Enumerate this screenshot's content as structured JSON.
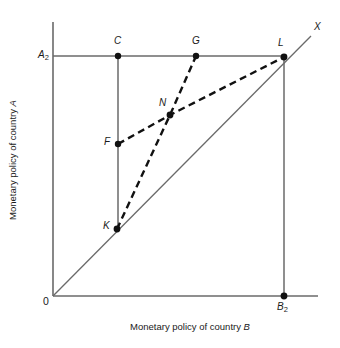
{
  "figure": {
    "title": "",
    "background_color": "#ffffff",
    "line_color": "#5a5a5a",
    "dashed_line_color": "#111111",
    "point_color": "#111111",
    "text_color": "#1a1a1a"
  },
  "axes": {
    "x_title_prefix": "Monetary policy of country ",
    "x_title_var": "B",
    "y_title_prefix": "Monetary policy of country ",
    "y_title_var": "A",
    "origin_label": "0",
    "x_tick_label": "B",
    "x_tick_sub": "2",
    "y_tick_label": "A",
    "y_tick_sub": "2"
  },
  "lines": {
    "diagonal_label": "X",
    "diagonal_name": "45-degree-line",
    "solid_segments": [
      {
        "name": "y-axis",
        "x1": 53,
        "y1": 22,
        "x2": 53,
        "y2": 296
      },
      {
        "name": "x-axis",
        "x1": 53,
        "y1": 296,
        "x2": 318,
        "y2": 296
      },
      {
        "name": "horizontal-a2-line",
        "x1": 53,
        "y1": 56,
        "x2": 285,
        "y2": 56
      },
      {
        "name": "vertical-c-k-line",
        "x1": 118,
        "y1": 56,
        "x2": 118,
        "y2": 229
      },
      {
        "name": "vertical-l-b2-line",
        "x1": 284,
        "y1": 57,
        "x2": 284,
        "y2": 296
      },
      {
        "name": "diagonal-45-line",
        "x1": 53,
        "y1": 296,
        "x2": 311,
        "y2": 36
      }
    ],
    "dashed_segments": [
      {
        "name": "reaction-curve-f-n-l",
        "points": [
          [
            118,
            144
          ],
          [
            170,
            115
          ],
          [
            284,
            57
          ]
        ]
      },
      {
        "name": "reaction-curve-k-n-g",
        "points": [
          [
            117,
            229
          ],
          [
            170,
            115
          ],
          [
            196,
            56
          ]
        ]
      }
    ]
  },
  "points": [
    {
      "id": "C",
      "label": "C",
      "x": 118,
      "y": 56,
      "label_x": 114,
      "label_y": 38
    },
    {
      "id": "G",
      "label": "G",
      "x": 196,
      "y": 56,
      "label_x": 192,
      "label_y": 38
    },
    {
      "id": "L",
      "label": "L",
      "x": 284,
      "y": 57,
      "label_x": 278,
      "label_y": 40
    },
    {
      "id": "N",
      "label": "N",
      "x": 170,
      "y": 115,
      "label_x": 160,
      "label_y": 99
    },
    {
      "id": "F",
      "label": "F",
      "x": 118,
      "y": 144,
      "label_x": 105,
      "label_y": 139
    },
    {
      "id": "K",
      "label": "K",
      "x": 117,
      "y": 229,
      "label_x": 104,
      "label_y": 223
    },
    {
      "id": "B2",
      "label": "B",
      "sub": "2",
      "x": 284,
      "y": 296,
      "label_x": 278,
      "label_y": 304
    }
  ],
  "tick_labels": {
    "a2_x": 39,
    "a2_y": 48,
    "origin_x": 44,
    "origin_y": 297,
    "x_label_pos": 318
  }
}
